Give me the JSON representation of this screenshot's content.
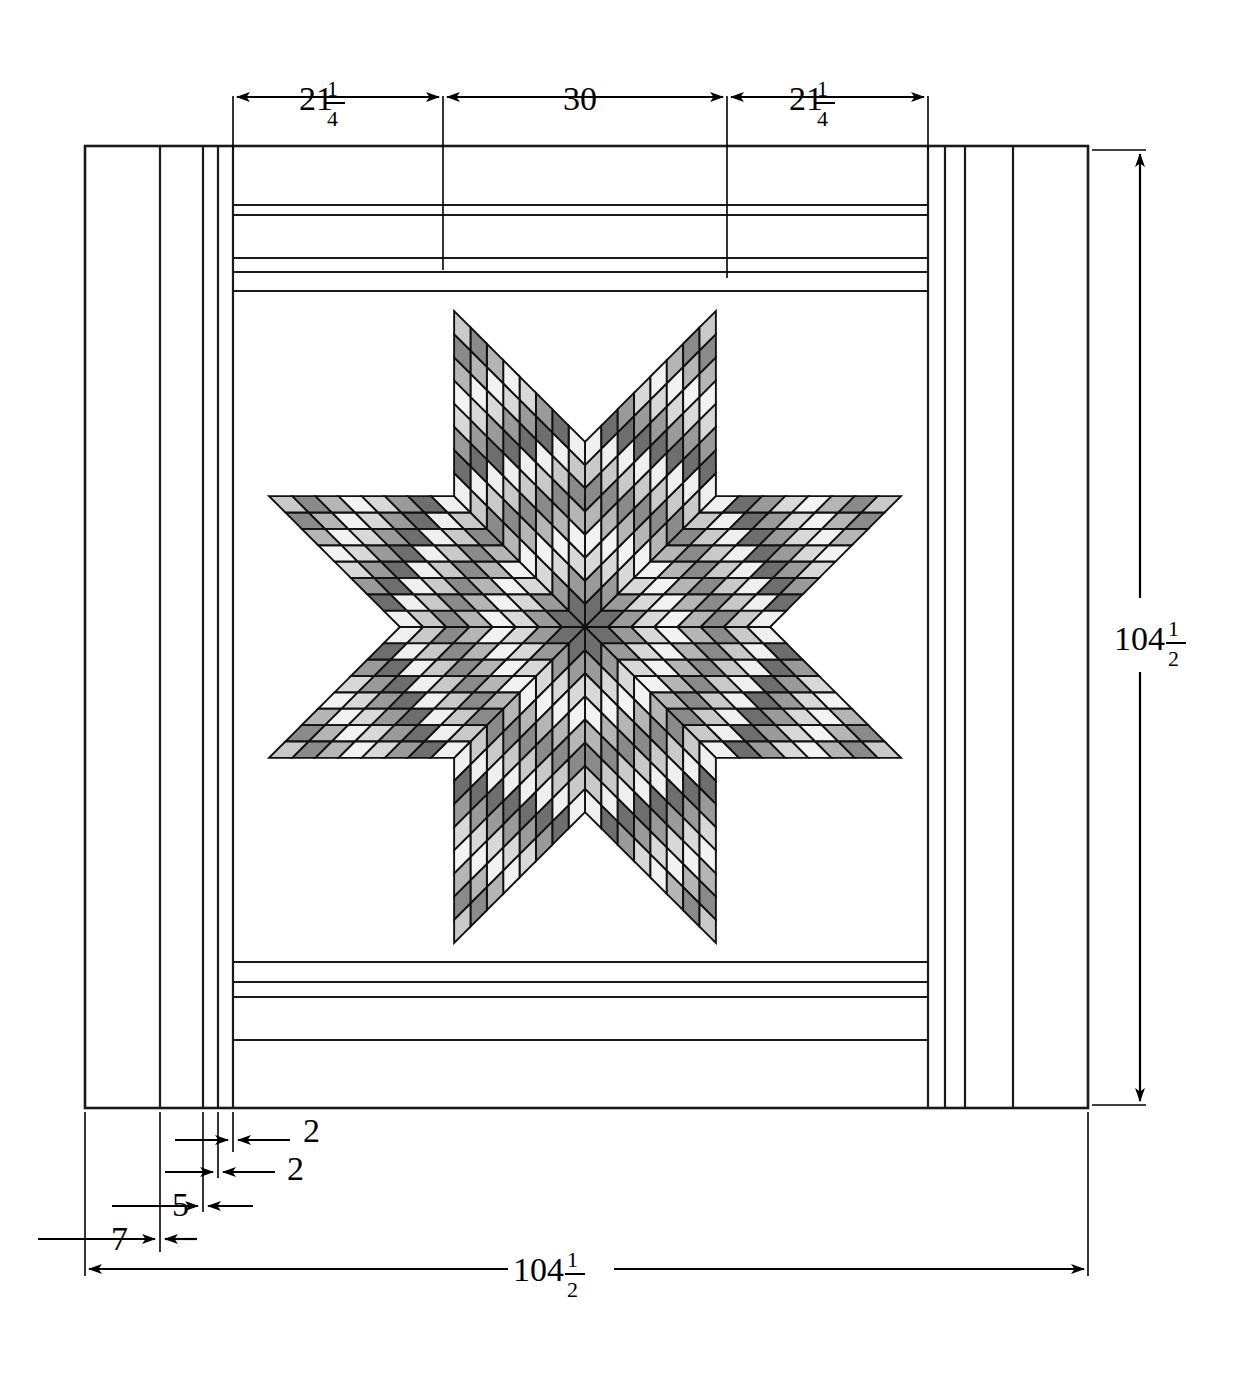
{
  "drawing": {
    "title": "Lone Star Quilt Construction Diagram",
    "units": "inches"
  },
  "dimensions": {
    "top": [
      {
        "name": "top-left-border-span",
        "whole": "21",
        "num": "1",
        "den": "4",
        "label": "21 1/4"
      },
      {
        "name": "top-center-star-span",
        "whole": "30",
        "num": "",
        "den": "",
        "label": "30"
      },
      {
        "name": "top-right-border-span",
        "whole": "21",
        "num": "1",
        "den": "4",
        "label": "21 1/4"
      }
    ],
    "right": {
      "name": "overall-height",
      "whole": "104",
      "num": "1",
      "den": "2",
      "label": "104 1/2"
    },
    "bottom": {
      "name": "overall-width",
      "whole": "104",
      "num": "1",
      "den": "2",
      "label": "104 1/2"
    },
    "border_widths": [
      {
        "name": "binding-width",
        "value": "7"
      },
      {
        "name": "outer-border-width",
        "value": "5"
      },
      {
        "name": "middle-strip-width",
        "value": "2"
      },
      {
        "name": "inner-strip-width",
        "value": "2"
      }
    ]
  },
  "star": {
    "name": "lone-star-block",
    "points": 8,
    "rows_per_point": 8,
    "columns_per_point": 8,
    "shade_ring_sequence": [
      "#6e6e6e",
      "#9a9a9a",
      "#d8d8d8",
      "#f2f2f2",
      "#b5b5b5",
      "#8a8a8a",
      "#c9c9c9",
      "#efefef"
    ]
  },
  "palette": {
    "ink": "#000000",
    "quilt_outline": "#1a1a1a",
    "background": "#ffffff",
    "shade_darkest": "#6e6e6e",
    "shade_dark": "#8a8a8a",
    "shade_mid": "#a8a8a8",
    "shade_light": "#cfcfcf",
    "shade_lightest": "#f2f2f2"
  },
  "geometry": {
    "quilt_left": 85,
    "quilt_right": 1088,
    "quilt_top": 146,
    "quilt_bottom": 1108,
    "border_lines_left": [
      85,
      160,
      203,
      218,
      233
    ],
    "border_lines_right": [
      1088,
      1013,
      965,
      945,
      928
    ],
    "border_lines_top": [
      146,
      205,
      215,
      255,
      270,
      290
    ],
    "border_lines_bottom": [
      1108,
      1040,
      1024,
      982,
      968,
      950
    ],
    "star_center_x": 585,
    "star_center_y": 627,
    "star_radius": 342
  }
}
